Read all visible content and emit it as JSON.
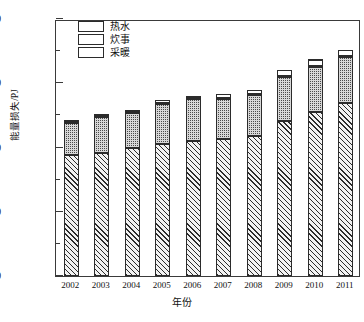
{
  "chart_data": {
    "type": "bar",
    "title": "",
    "xlabel": "年份",
    "ylabel": "能量损失/PJ",
    "ylim": [
      0,
      2000
    ],
    "yticks": [
      0,
      500,
      1000,
      1500,
      2000
    ],
    "ytick_labels": [
      "0",
      "500",
      "1000",
      "1500",
      "2000"
    ],
    "yminor_step": 250,
    "grid": false,
    "stacked": true,
    "legend_position": "upper-left",
    "categories": [
      "2002",
      "2003",
      "2004",
      "2005",
      "2006",
      "2007",
      "2008",
      "2009",
      "2010",
      "2011"
    ],
    "series": [
      {
        "name": "采暖",
        "pattern": "diagonal-hatch",
        "values": [
          945,
          960,
          1000,
          1030,
          1050,
          1065,
          1090,
          1205,
          1280,
          1345
        ]
      },
      {
        "name": "炊事",
        "pattern": "dark-checker",
        "values": [
          245,
          275,
          265,
          305,
          330,
          310,
          315,
          345,
          350,
          360
        ]
      },
      {
        "name": "热水",
        "pattern": "horizontal-lines",
        "values": [
          25,
          25,
          30,
          35,
          20,
          40,
          45,
          55,
          60,
          55
        ]
      }
    ],
    "totals": [
      1215,
      1260,
      1295,
      1370,
      1400,
      1415,
      1450,
      1605,
      1690,
      1760
    ]
  },
  "legend": {
    "items": [
      {
        "label": "热水",
        "swatch": "horizontal-lines-swatch"
      },
      {
        "label": "炊事",
        "swatch": "dark-checker-swatch"
      },
      {
        "label": "采暖",
        "swatch": "diagonal-hatch-swatch"
      }
    ]
  },
  "axes": {
    "y_title": "能量损失/PJ",
    "x_title": "年份"
  }
}
